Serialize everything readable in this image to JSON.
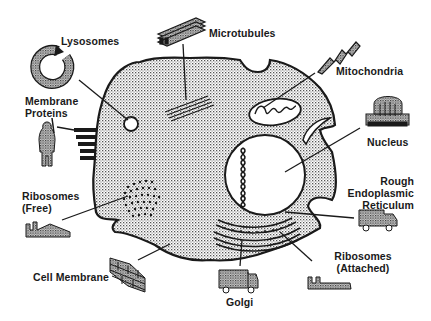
{
  "diagram": {
    "colors": {
      "ink": "#1a1a1a",
      "cytoplasm_stipple": "#6b6b6b",
      "background": "#ffffff",
      "nucleus_fill": "#ffffff"
    },
    "labels": {
      "lysosomes": "Lysosomes",
      "microtubules": "Microtubules",
      "mitochondria": "Mitochondria",
      "membrane_proteins_1": "Membrane",
      "membrane_proteins_2": "Proteins",
      "nucleus": "Nucleus",
      "rough_er_1": "Rough",
      "rough_er_2": "Endoplasmic",
      "rough_er_3": "Reticulum",
      "ribosomes_free_1": "Ribosomes",
      "ribosomes_free_2": "(Free)",
      "ribosomes_attached_1": "Ribosomes",
      "ribosomes_attached_2": "(Attached)",
      "cell_membrane": "Cell Membrane",
      "golgi": "Golgi"
    },
    "analogy_icons": {
      "lysosomes": "recycling-ring-icon",
      "microtubules": "stacked-beams-icon",
      "mitochondria": "lightning-bolt-icon",
      "membrane_proteins": "guard-person-icon",
      "nucleus": "capitol-building-icon",
      "rough_er": "delivery-truck-icon",
      "ribosomes_free": "factory-icon",
      "ribosomes_attached": "factory-icon",
      "cell_membrane": "brick-wall-icon",
      "golgi": "delivery-truck-icon"
    }
  }
}
